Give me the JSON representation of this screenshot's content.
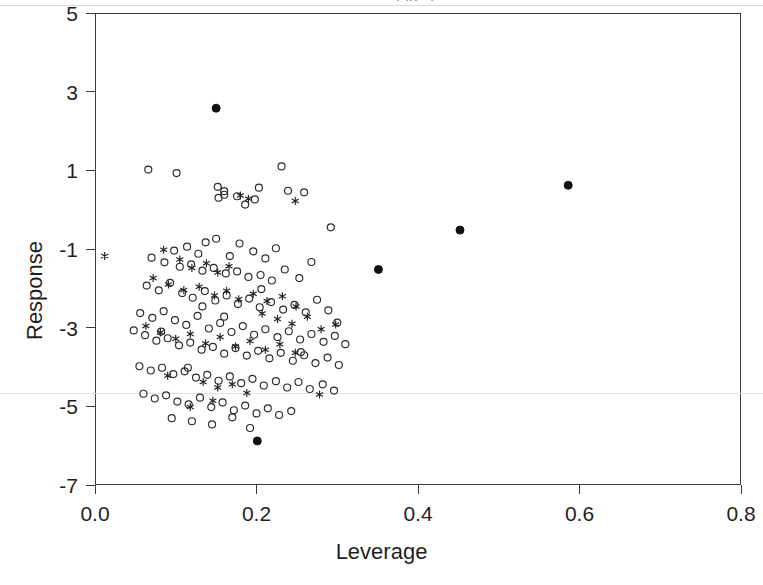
{
  "figure": {
    "kind": "scatter-plot",
    "background": "#ffffff",
    "frame_color": "#3a3a3a",
    "artifact_line_color": "#e2e2e2",
    "top_caption_fragment": "Fig. 7"
  },
  "chart_data": {
    "type": "scatter",
    "title": "",
    "xlabel": "Leverage",
    "ylabel": "Response",
    "xlim": [
      0.0,
      0.8
    ],
    "ylim": [
      -7,
      5
    ],
    "xticks": [
      0.0,
      0.2,
      0.4,
      0.6,
      0.8
    ],
    "xticklabels": [
      "0.0",
      "0.2",
      "0.4",
      "0.6",
      "0.8"
    ],
    "yticks": [
      5,
      3,
      1,
      -1,
      -3,
      -5,
      -7
    ],
    "yticklabels": [
      "5",
      "3",
      "1",
      "-1",
      "-3",
      "-5",
      "-7"
    ],
    "grid": false,
    "legend": null,
    "legend_position": "none",
    "annotations": [
      {
        "name": "reference-line",
        "kind": "horizontal-line",
        "y": -4.65,
        "color": "#e2e2e2",
        "note": "faint full-width horizontal rule (scan artifact)"
      }
    ],
    "series": [
      {
        "name": "open-circle",
        "marker": "circle-open",
        "color": "#2b2b2b",
        "fill": "none",
        "size": 7,
        "count": 137,
        "points": [
          [
            0.066,
            1.02
          ],
          [
            0.101,
            0.93
          ],
          [
            0.152,
            0.58
          ],
          [
            0.16,
            0.47
          ],
          [
            0.153,
            0.3
          ],
          [
            0.176,
            0.34
          ],
          [
            0.203,
            0.56
          ],
          [
            0.231,
            1.1
          ],
          [
            0.239,
            0.48
          ],
          [
            0.259,
            0.44
          ],
          [
            0.186,
            0.13
          ],
          [
            0.198,
            0.26
          ],
          [
            0.292,
            -0.45
          ],
          [
            0.16,
            0.38
          ],
          [
            0.137,
            -0.83
          ],
          [
            0.114,
            -0.94
          ],
          [
            0.098,
            -1.04
          ],
          [
            0.128,
            -1.12
          ],
          [
            0.15,
            -0.74
          ],
          [
            0.167,
            -1.18
          ],
          [
            0.179,
            -0.86
          ],
          [
            0.196,
            -1.06
          ],
          [
            0.211,
            -1.24
          ],
          [
            0.224,
            -0.98
          ],
          [
            0.07,
            -1.22
          ],
          [
            0.086,
            -1.34
          ],
          [
            0.105,
            -1.45
          ],
          [
            0.119,
            -1.39
          ],
          [
            0.133,
            -1.55
          ],
          [
            0.147,
            -1.48
          ],
          [
            0.162,
            -1.62
          ],
          [
            0.176,
            -1.57
          ],
          [
            0.19,
            -1.71
          ],
          [
            0.205,
            -1.66
          ],
          [
            0.219,
            -1.8
          ],
          [
            0.235,
            -1.52
          ],
          [
            0.253,
            -1.74
          ],
          [
            0.268,
            -1.33
          ],
          [
            0.064,
            -1.93
          ],
          [
            0.079,
            -2.05
          ],
          [
            0.093,
            -1.86
          ],
          [
            0.108,
            -2.12
          ],
          [
            0.121,
            -2.24
          ],
          [
            0.136,
            -2.07
          ],
          [
            0.149,
            -2.31
          ],
          [
            0.163,
            -2.18
          ],
          [
            0.177,
            -2.4
          ],
          [
            0.191,
            -2.26
          ],
          [
            0.204,
            -2.48
          ],
          [
            0.218,
            -2.35
          ],
          [
            0.233,
            -2.54
          ],
          [
            0.247,
            -2.42
          ],
          [
            0.261,
            -2.61
          ],
          [
            0.275,
            -2.29
          ],
          [
            0.289,
            -2.56
          ],
          [
            0.3,
            -2.87
          ],
          [
            0.056,
            -2.63
          ],
          [
            0.071,
            -2.75
          ],
          [
            0.085,
            -2.58
          ],
          [
            0.099,
            -2.81
          ],
          [
            0.113,
            -2.93
          ],
          [
            0.127,
            -2.7
          ],
          [
            0.141,
            -3.02
          ],
          [
            0.155,
            -2.88
          ],
          [
            0.169,
            -3.11
          ],
          [
            0.183,
            -2.96
          ],
          [
            0.197,
            -3.18
          ],
          [
            0.211,
            -3.04
          ],
          [
            0.226,
            -3.24
          ],
          [
            0.24,
            -3.09
          ],
          [
            0.254,
            -3.3
          ],
          [
            0.268,
            -3.16
          ],
          [
            0.283,
            -3.36
          ],
          [
            0.297,
            -3.21
          ],
          [
            0.31,
            -3.42
          ],
          [
            0.048,
            -3.07
          ],
          [
            0.062,
            -3.19
          ],
          [
            0.076,
            -3.33
          ],
          [
            0.09,
            -3.27
          ],
          [
            0.104,
            -3.45
          ],
          [
            0.118,
            -3.38
          ],
          [
            0.132,
            -3.56
          ],
          [
            0.146,
            -3.49
          ],
          [
            0.16,
            -3.66
          ],
          [
            0.174,
            -3.52
          ],
          [
            0.188,
            -3.71
          ],
          [
            0.202,
            -3.59
          ],
          [
            0.216,
            -3.78
          ],
          [
            0.23,
            -3.64
          ],
          [
            0.245,
            -3.84
          ],
          [
            0.259,
            -3.7
          ],
          [
            0.273,
            -3.9
          ],
          [
            0.288,
            -3.76
          ],
          [
            0.302,
            -3.95
          ],
          [
            0.055,
            -3.98
          ],
          [
            0.069,
            -4.09
          ],
          [
            0.083,
            -4.02
          ],
          [
            0.097,
            -4.18
          ],
          [
            0.111,
            -4.11
          ],
          [
            0.125,
            -4.27
          ],
          [
            0.139,
            -4.2
          ],
          [
            0.153,
            -4.35
          ],
          [
            0.167,
            -4.24
          ],
          [
            0.181,
            -4.41
          ],
          [
            0.195,
            -4.3
          ],
          [
            0.209,
            -4.47
          ],
          [
            0.224,
            -4.36
          ],
          [
            0.238,
            -4.52
          ],
          [
            0.252,
            -4.38
          ],
          [
            0.266,
            -4.56
          ],
          [
            0.282,
            -4.44
          ],
          [
            0.296,
            -4.6
          ],
          [
            0.06,
            -4.68
          ],
          [
            0.074,
            -4.8
          ],
          [
            0.088,
            -4.72
          ],
          [
            0.102,
            -4.88
          ],
          [
            0.116,
            -4.95
          ],
          [
            0.13,
            -4.78
          ],
          [
            0.144,
            -5.02
          ],
          [
            0.158,
            -4.9
          ],
          [
            0.172,
            -5.1
          ],
          [
            0.186,
            -4.98
          ],
          [
            0.2,
            -5.18
          ],
          [
            0.214,
            -5.05
          ],
          [
            0.228,
            -5.22
          ],
          [
            0.095,
            -5.3
          ],
          [
            0.12,
            -5.38
          ],
          [
            0.145,
            -5.46
          ],
          [
            0.17,
            -5.28
          ],
          [
            0.192,
            -5.55
          ],
          [
            0.243,
            -5.12
          ],
          [
            0.115,
            -4.02
          ],
          [
            0.082,
            -3.1
          ],
          [
            0.206,
            -2.02
          ],
          [
            0.16,
            -2.72
          ],
          [
            0.133,
            -2.46
          ],
          [
            0.255,
            -3.62
          ]
        ]
      },
      {
        "name": "asterisk",
        "marker": "star-6",
        "color": "#222222",
        "size": 8,
        "count": 46,
        "points": [
          [
            0.012,
            -1.18
          ],
          [
            0.085,
            -1.02
          ],
          [
            0.18,
            0.36
          ],
          [
            0.19,
            0.28
          ],
          [
            0.248,
            0.22
          ],
          [
            0.105,
            -1.27
          ],
          [
            0.12,
            -1.48
          ],
          [
            0.138,
            -1.36
          ],
          [
            0.152,
            -1.6
          ],
          [
            0.166,
            -1.44
          ],
          [
            0.072,
            -1.74
          ],
          [
            0.091,
            -1.9
          ],
          [
            0.11,
            -2.04
          ],
          [
            0.129,
            -1.96
          ],
          [
            0.148,
            -2.18
          ],
          [
            0.163,
            -2.06
          ],
          [
            0.178,
            -2.28
          ],
          [
            0.196,
            -2.14
          ],
          [
            0.213,
            -2.32
          ],
          [
            0.232,
            -2.2
          ],
          [
            0.249,
            -2.46
          ],
          [
            0.207,
            -2.64
          ],
          [
            0.226,
            -2.78
          ],
          [
            0.244,
            -2.9
          ],
          [
            0.263,
            -2.72
          ],
          [
            0.28,
            -3.04
          ],
          [
            0.298,
            -2.92
          ],
          [
            0.063,
            -2.96
          ],
          [
            0.081,
            -3.12
          ],
          [
            0.1,
            -3.28
          ],
          [
            0.118,
            -3.16
          ],
          [
            0.137,
            -3.4
          ],
          [
            0.155,
            -3.24
          ],
          [
            0.174,
            -3.48
          ],
          [
            0.192,
            -3.34
          ],
          [
            0.211,
            -3.56
          ],
          [
            0.229,
            -3.42
          ],
          [
            0.248,
            -3.64
          ],
          [
            0.09,
            -4.22
          ],
          [
            0.134,
            -4.38
          ],
          [
            0.152,
            -4.52
          ],
          [
            0.17,
            -4.44
          ],
          [
            0.188,
            -4.66
          ],
          [
            0.146,
            -4.86
          ],
          [
            0.118,
            -5.02
          ],
          [
            0.278,
            -4.7
          ]
        ]
      },
      {
        "name": "filled-circle",
        "marker": "circle-filled",
        "color": "#111111",
        "size": 8,
        "count": 5,
        "points": [
          [
            0.15,
            2.58
          ],
          [
            0.201,
            -5.88
          ],
          [
            0.351,
            -1.52
          ],
          [
            0.452,
            -0.52
          ],
          [
            0.586,
            0.62
          ]
        ]
      }
    ]
  },
  "axes": {
    "x": {
      "title": "Leverage",
      "ticks": [
        {
          "value": 0.0,
          "label": "0.0"
        },
        {
          "value": 0.2,
          "label": "0.2"
        },
        {
          "value": 0.4,
          "label": "0.4"
        },
        {
          "value": 0.6,
          "label": "0.6"
        },
        {
          "value": 0.8,
          "label": "0.8"
        }
      ]
    },
    "y": {
      "title": "Response",
      "ticks": [
        {
          "value": 5,
          "label": "5"
        },
        {
          "value": 3,
          "label": "3"
        },
        {
          "value": 1,
          "label": "1"
        },
        {
          "value": -1,
          "label": "-1"
        },
        {
          "value": -3,
          "label": "-3"
        },
        {
          "value": -5,
          "label": "-5"
        },
        {
          "value": -7,
          "label": "-7"
        }
      ]
    }
  }
}
